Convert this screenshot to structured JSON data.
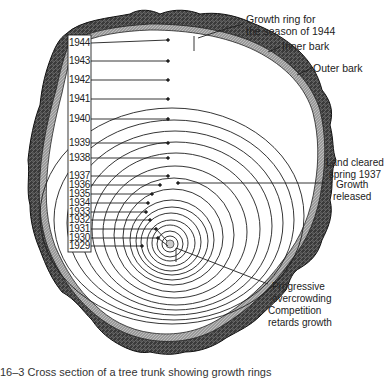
{
  "diagram": {
    "years": [
      {
        "label": "1944",
        "y": 43
      },
      {
        "label": "1943",
        "y": 61
      },
      {
        "label": "1942",
        "y": 80
      },
      {
        "label": "1941",
        "y": 99
      },
      {
        "label": "1940",
        "y": 119
      },
      {
        "label": "1939",
        "y": 143
      },
      {
        "label": "1938",
        "y": 158
      },
      {
        "label": "1937",
        "y": 176
      },
      {
        "label": "1936",
        "y": 185
      },
      {
        "label": "1935",
        "y": 194
      },
      {
        "label": "1934",
        "y": 203
      },
      {
        "label": "1933",
        "y": 212
      },
      {
        "label": "1932",
        "y": 220
      },
      {
        "label": "1931",
        "y": 229
      },
      {
        "label": "1930",
        "y": 238
      },
      {
        "label": "1929",
        "y": 246
      }
    ],
    "annotations": {
      "growth_ring_line1": "Growth ring for",
      "growth_ring_line2": "the season of 1944",
      "inner_bark": "Inner bark",
      "outer_bark": "Outer bark",
      "land_cleared_line1": "Land cleared",
      "land_cleared_line2": "spring 1937",
      "growth_released_line1": "Growth",
      "growth_released_line2": "released",
      "overcrowding_line1": "Progressive",
      "overcrowding_line2": "overcrowding",
      "competition_line1": "Competition",
      "competition_line2": "retards growth"
    },
    "colors": {
      "ink": "#1a1a1a",
      "bark": "#2b2b2b",
      "background": "#ffffff"
    }
  },
  "caption": "16–3  Cross section of a tree trunk showing growth rings"
}
